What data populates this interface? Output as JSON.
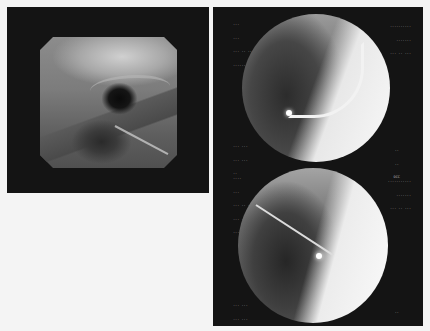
{
  "figure": {
    "left_panel": {
      "type": "endoscopy",
      "shape": "octagon",
      "description": "Endoscopic view of airway lumen with dark central opening and instrument streak"
    },
    "right_panel": {
      "type": "fluoroscopy",
      "frames": [
        {
          "position": "top",
          "description": "Fluoroscopic chest view with curved catheter tip",
          "overlay": {
            "top_left": [
              "...",
              "...",
              "... .. ..",
              "......."
            ],
            "top_right": [
              "..........",
              ".......",
              "... .. ..."
            ],
            "bottom_left": [
              "... ...",
              "... ...",
              ".."
            ],
            "bottom_right": [
              "..",
              "..",
              "OCC"
            ]
          }
        },
        {
          "position": "bottom",
          "description": "Fluoroscopic chest view with straight wire and bright tip",
          "overlay": {
            "top_left": [
              "....",
              "...",
              "... .. ..",
              "... ....",
              "......."
            ],
            "top_right": [
              "...........",
              ".......",
              "... .. ..."
            ],
            "bottom_left": [
              "... ...",
              "... ...",
              ".."
            ],
            "bottom_right": [
              "..",
              "..",
              "OCC"
            ]
          }
        }
      ]
    }
  },
  "colors": {
    "page_background": "#f4f4f4",
    "panel_background": "#141414",
    "overlay_text": "#bfbfbf"
  }
}
